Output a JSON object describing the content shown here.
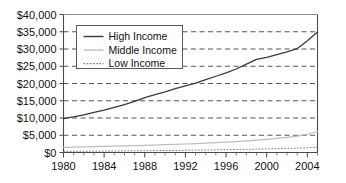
{
  "chart_data": {
    "type": "line",
    "title": "",
    "xlabel": "",
    "ylabel": "",
    "xlim": [
      1980,
      2005
    ],
    "ylim": [
      0,
      40000
    ],
    "ytick_step": 5000,
    "grid": true,
    "grid_style": "horizontal-dashed",
    "legend_position": "upper-left-inside",
    "x": [
      1980,
      1981,
      1982,
      1983,
      1984,
      1985,
      1986,
      1987,
      1988,
      1989,
      1990,
      1991,
      1992,
      1993,
      1994,
      1995,
      1996,
      1997,
      1998,
      1999,
      2000,
      2001,
      2002,
      2003,
      2004,
      2005
    ],
    "xticks": [
      1980,
      1984,
      1988,
      1992,
      1996,
      2000,
      2004
    ],
    "xtick_labels": [
      "1980",
      "1984",
      "1988",
      "1992",
      "1996",
      "2000",
      "2004"
    ],
    "yticks": [
      0,
      5000,
      10000,
      15000,
      20000,
      25000,
      30000,
      35000,
      40000
    ],
    "ytick_labels": [
      "$0",
      "$5,000",
      "$10,000",
      "$15,000",
      "$20,000",
      "$25,000",
      "$30,000",
      "$35,000",
      "$40,000"
    ],
    "series": [
      {
        "name": "High Income",
        "style": "solid",
        "color": "#3a3a3a",
        "values": [
          9800,
          10300,
          10900,
          11600,
          12300,
          13100,
          13900,
          14800,
          15900,
          16800,
          17600,
          18500,
          19300,
          20100,
          21100,
          22100,
          23100,
          24200,
          25600,
          27000,
          27600,
          28400,
          29200,
          30100,
          32400,
          34900
        ]
      },
      {
        "name": "Middle Income",
        "style": "solid",
        "color": "#bdbdbd",
        "values": [
          1500,
          1560,
          1620,
          1680,
          1750,
          1820,
          1900,
          1980,
          2070,
          2160,
          2260,
          2360,
          2470,
          2590,
          2720,
          2860,
          3010,
          3180,
          3370,
          3580,
          3820,
          4090,
          4400,
          4760,
          5300,
          6100
        ]
      },
      {
        "name": "Low Income",
        "style": "dotted",
        "color": "#777777",
        "values": [
          320,
          340,
          360,
          385,
          410,
          435,
          460,
          490,
          520,
          550,
          585,
          620,
          655,
          695,
          735,
          780,
          825,
          875,
          925,
          980,
          1040,
          1100,
          1170,
          1250,
          1360,
          1550
        ]
      }
    ],
    "legend": [
      {
        "label": "High Income",
        "style": "solid",
        "color": "#3a3a3a"
      },
      {
        "label": "Middle Income",
        "style": "solid",
        "color": "#c2c2c2"
      },
      {
        "label": "Low Income",
        "style": "dotted",
        "color": "#777777"
      }
    ]
  }
}
